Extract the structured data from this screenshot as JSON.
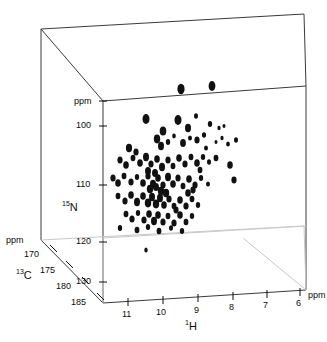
{
  "figure": {
    "kind": "3d-nmr-spectrum-cube",
    "background_color": "#ffffff",
    "peak_color": "#111111",
    "frame_color": "#3a3a3a",
    "frame_color_light": "#c9c9c9"
  },
  "axes": {
    "h": {
      "name": "1H",
      "isotope_superscript": "1",
      "element": "H",
      "unit": "ppm",
      "ticks": [
        "11",
        "10",
        "9",
        "8",
        "7",
        "6"
      ],
      "tick_values": [
        11,
        10,
        9,
        8,
        7,
        6
      ],
      "range": [
        11.5,
        5.5
      ],
      "direction": "decreasing"
    },
    "n": {
      "name": "15N",
      "isotope_superscript": "15",
      "element": "N",
      "unit": "ppm",
      "ticks": [
        "100",
        "110",
        "120",
        "130"
      ],
      "tick_values": [
        100,
        110,
        120,
        130
      ],
      "range": [
        94,
        133
      ],
      "direction": "decreasing-upward"
    },
    "c": {
      "name": "13C",
      "isotope_superscript": "13",
      "element": "C",
      "unit": "ppm",
      "ticks": [
        "170",
        "175",
        "180",
        "185"
      ],
      "tick_values": [
        170,
        175,
        180,
        185
      ],
      "range": [
        168,
        186
      ],
      "direction": "increasing-toward-viewer"
    }
  },
  "chart_data": {
    "type": "scatter",
    "title": "",
    "xlabel": "1H",
    "ylabel": "15N",
    "zlabel": "13C",
    "xunit": "ppm",
    "yunit": "ppm",
    "zunit": "ppm",
    "xlim": [
      11.5,
      5.5
    ],
    "ylim": [
      133,
      94
    ],
    "zlim": [
      168,
      186
    ],
    "grid": false,
    "legend": "none",
    "projection": "3d-oblique-cube",
    "marker": "filled-ellipse",
    "point_count": 108,
    "note": "Peak positions given as projected canvas coordinates (px) with estimated radii; cube encloses the 3D chemical-shift space.",
    "points_px": [
      [
        181,
        89,
        3.6,
        5.2
      ],
      [
        212,
        86,
        3.4,
        5.0
      ],
      [
        146,
        119,
        3.5,
        5.0
      ],
      [
        178,
        120,
        3.5,
        5.0
      ],
      [
        196,
        116,
        2.0,
        2.8
      ],
      [
        163,
        131,
        3.3,
        4.6
      ],
      [
        188,
        128,
        3.0,
        4.2
      ],
      [
        210,
        124,
        2.2,
        3.0
      ],
      [
        219,
        128,
        1.6,
        2.2
      ],
      [
        224,
        126,
        1.5,
        2.0
      ],
      [
        129,
        148,
        3.1,
        4.2
      ],
      [
        136,
        152,
        2.6,
        3.6
      ],
      [
        157,
        139,
        3.2,
        4.4
      ],
      [
        161,
        146,
        3.0,
        4.2
      ],
      [
        168,
        142,
        2.2,
        3.0
      ],
      [
        174,
        136,
        1.8,
        2.4
      ],
      [
        183,
        143,
        2.9,
        4.0
      ],
      [
        190,
        138,
        2.0,
        2.6
      ],
      [
        197,
        140,
        2.6,
        3.6
      ],
      [
        204,
        135,
        2.1,
        2.8
      ],
      [
        216,
        142,
        1.5,
        2.0
      ],
      [
        222,
        138,
        1.6,
        2.2
      ],
      [
        228,
        144,
        1.9,
        2.6
      ],
      [
        236,
        140,
        2.0,
        2.8
      ],
      [
        120,
        160,
        2.6,
        3.6
      ],
      [
        126,
        165,
        2.8,
        3.8
      ],
      [
        133,
        158,
        2.4,
        3.2
      ],
      [
        140,
        163,
        2.8,
        3.8
      ],
      [
        146,
        157,
        3.0,
        4.2
      ],
      [
        151,
        164,
        2.6,
        3.6
      ],
      [
        157,
        159,
        2.8,
        3.8
      ],
      [
        162,
        167,
        3.0,
        4.2
      ],
      [
        168,
        160,
        2.6,
        3.6
      ],
      [
        173,
        166,
        2.4,
        3.2
      ],
      [
        179,
        158,
        2.8,
        3.8
      ],
      [
        185,
        164,
        2.6,
        3.6
      ],
      [
        191,
        157,
        2.4,
        3.2
      ],
      [
        197,
        163,
        2.8,
        3.8
      ],
      [
        203,
        157,
        2.2,
        3.0
      ],
      [
        209,
        162,
        2.0,
        2.8
      ],
      [
        216,
        158,
        2.4,
        3.2
      ],
      [
        230,
        165,
        2.8,
        3.8
      ],
      [
        113,
        178,
        2.6,
        3.6
      ],
      [
        118,
        183,
        2.8,
        3.8
      ],
      [
        124,
        176,
        2.4,
        3.2
      ],
      [
        131,
        182,
        2.6,
        3.6
      ],
      [
        137,
        177,
        2.2,
        3.0
      ],
      [
        143,
        183,
        2.8,
        3.8
      ],
      [
        148,
        176,
        2.6,
        3.6
      ],
      [
        153,
        184,
        3.0,
        4.2
      ],
      [
        158,
        178,
        2.8,
        3.8
      ],
      [
        163,
        185,
        2.6,
        3.6
      ],
      [
        168,
        177,
        3.0,
        4.2
      ],
      [
        173,
        184,
        2.8,
        3.8
      ],
      [
        178,
        178,
        2.6,
        3.6
      ],
      [
        183,
        186,
        2.4,
        3.2
      ],
      [
        189,
        179,
        2.8,
        3.8
      ],
      [
        195,
        185,
        2.6,
        3.6
      ],
      [
        201,
        178,
        2.2,
        3.0
      ],
      [
        208,
        184,
        2.0,
        2.6
      ],
      [
        118,
        196,
        2.4,
        3.2
      ],
      [
        125,
        201,
        2.6,
        3.6
      ],
      [
        131,
        195,
        2.8,
        3.8
      ],
      [
        137,
        202,
        3.0,
        4.2
      ],
      [
        143,
        196,
        2.8,
        3.8
      ],
      [
        148,
        203,
        3.2,
        4.4
      ],
      [
        152,
        197,
        3.0,
        4.2
      ],
      [
        156,
        204,
        3.2,
        4.4
      ],
      [
        160,
        198,
        3.0,
        4.2
      ],
      [
        164,
        205,
        2.8,
        3.8
      ],
      [
        169,
        199,
        2.6,
        3.6
      ],
      [
        174,
        206,
        2.4,
        3.2
      ],
      [
        180,
        200,
        2.8,
        3.8
      ],
      [
        186,
        206,
        2.6,
        3.6
      ],
      [
        192,
        199,
        2.4,
        3.2
      ],
      [
        198,
        205,
        2.2,
        3.0
      ],
      [
        126,
        214,
        2.4,
        3.2
      ],
      [
        132,
        219,
        2.6,
        3.6
      ],
      [
        138,
        213,
        2.2,
        3.0
      ],
      [
        144,
        220,
        2.6,
        3.6
      ],
      [
        149,
        214,
        2.8,
        3.8
      ],
      [
        154,
        221,
        3.0,
        4.2
      ],
      [
        158,
        215,
        2.8,
        3.8
      ],
      [
        163,
        222,
        2.6,
        3.6
      ],
      [
        168,
        216,
        2.4,
        3.2
      ],
      [
        174,
        223,
        2.6,
        3.6
      ],
      [
        180,
        215,
        2.8,
        3.8
      ],
      [
        186,
        222,
        2.4,
        3.2
      ],
      [
        192,
        216,
        2.2,
        3.0
      ],
      [
        120,
        228,
        2.2,
        3.0
      ],
      [
        137,
        230,
        2.4,
        3.2
      ],
      [
        148,
        227,
        2.2,
        3.0
      ],
      [
        159,
        231,
        2.4,
        3.2
      ],
      [
        171,
        228,
        2.0,
        2.8
      ],
      [
        182,
        231,
        2.2,
        3.0
      ],
      [
        146,
        250,
        1.7,
        2.6
      ],
      [
        148,
        171,
        3.0,
        4.0
      ],
      [
        155,
        173,
        3.0,
        4.0
      ],
      [
        161,
        191,
        3.2,
        4.2
      ],
      [
        166,
        193,
        3.2,
        4.2
      ],
      [
        150,
        189,
        3.2,
        4.2
      ],
      [
        156,
        187,
        3.0,
        4.0
      ],
      [
        188,
        193,
        2.8,
        3.8
      ],
      [
        193,
        190,
        2.6,
        3.4
      ],
      [
        176,
        210,
        2.6,
        3.4
      ],
      [
        200,
        170,
        2.4,
        3.2
      ],
      [
        206,
        148,
        2.0,
        2.6
      ],
      [
        234,
        180,
        2.6,
        3.4
      ]
    ]
  },
  "cube": {
    "description": "Oblique projection cube enclosing spectrum",
    "vertices_px": {
      "back_top_left": [
        41,
        29
      ],
      "back_top_right": [
        304,
        14
      ],
      "back_bottom_left": [
        41,
        240
      ],
      "back_bottom_right": [
        304,
        226
      ],
      "front_top_left": [
        103,
        101
      ],
      "front_top_right": [
        306,
        86
      ],
      "front_bottom_left": [
        103,
        303
      ],
      "front_bottom_right": [
        306,
        290
      ]
    }
  },
  "labels": {
    "n_unit": "ppm",
    "c_unit": "ppm",
    "h_unit": "ppm"
  }
}
